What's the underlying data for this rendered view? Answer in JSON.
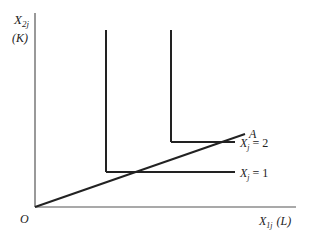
{
  "diagram": {
    "type": "isoquant-leontief",
    "axes": {
      "y_label_main": "X",
      "y_label_sub": "2j",
      "y_label_paren": "(K)",
      "x_label_main": "X",
      "x_label_sub": "1j",
      "x_label_paren": "(L)",
      "origin_label": "O"
    },
    "ray": {
      "label": "A"
    },
    "isoquants": [
      {
        "name": "X",
        "sub": "j",
        "eq": "= 1"
      },
      {
        "name": "X",
        "sub": "j",
        "eq": "= 2"
      }
    ],
    "colors": {
      "line": "#222222",
      "axis": "#555555",
      "background": "#ffffff"
    }
  }
}
